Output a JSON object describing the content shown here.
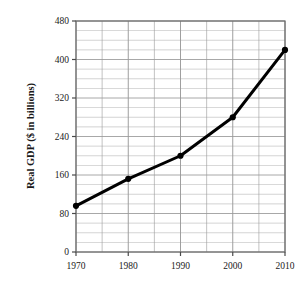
{
  "chart_data": {
    "type": "line",
    "title": "",
    "subtitle": "",
    "xlabel": "",
    "ylabel": "Real GDP ($ in billions)",
    "x": [
      1970,
      1980,
      1990,
      2000,
      2010
    ],
    "values": [
      96,
      152,
      200,
      280,
      420
    ],
    "series": [
      {
        "name": "Real GDP",
        "values": [
          96,
          152,
          200,
          280,
          420
        ]
      }
    ],
    "categories": [
      "1970",
      "1980",
      "1990",
      "2000",
      "2010"
    ],
    "xlim": [
      1970,
      2010
    ],
    "ylim": [
      0,
      480
    ],
    "ytick_labels": [
      "0",
      "80",
      "160",
      "240",
      "320",
      "400",
      "480"
    ],
    "ytick_values": [
      0,
      80,
      160,
      240,
      320,
      400,
      480
    ],
    "xtick_labels": [
      "1970",
      "1980",
      "1990",
      "2000",
      "2010"
    ],
    "xtick_values": [
      1970,
      1980,
      1990,
      2000,
      2010
    ],
    "y_minor_step": 20,
    "x_minor_step": 5,
    "grid": true,
    "grid_color": "#9a9a9a",
    "legend": false,
    "legend_position": "none",
    "line_color": "#000000",
    "marker": "circle",
    "marker_color": "#000000",
    "frame_color": "#6b6b6b",
    "background": "#ffffff"
  },
  "axis": {
    "ylabel": "Real GDP ($ in billions)",
    "yticks": [
      {
        "label": "480",
        "value": 480
      },
      {
        "label": "400",
        "value": 400
      },
      {
        "label": "320",
        "value": 320
      },
      {
        "label": "240",
        "value": 240
      },
      {
        "label": "160",
        "value": 160
      },
      {
        "label": "80",
        "value": 80
      },
      {
        "label": "0",
        "value": 0
      }
    ],
    "xticks": [
      {
        "label": "1970",
        "value": 1970
      },
      {
        "label": "1980",
        "value": 1980
      },
      {
        "label": "1990",
        "value": 1990
      },
      {
        "label": "2000",
        "value": 2000
      },
      {
        "label": "2010",
        "value": 2010
      }
    ]
  }
}
